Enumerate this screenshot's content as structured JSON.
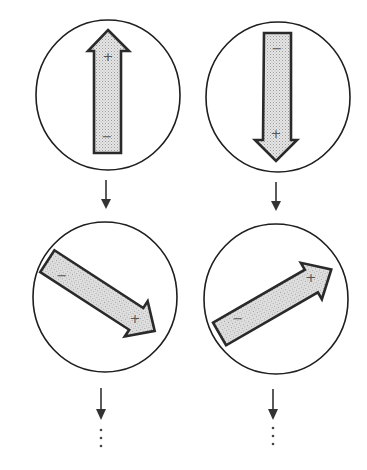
{
  "diagram": {
    "colors": {
      "outline": "#1e1e1e",
      "magnet_fill": "#d9d9d9",
      "magnet_stroke": "#2a2a2a",
      "background": "#ffffff"
    },
    "columns": [
      {
        "name": "left",
        "steps": [
          {
            "orientation": "up",
            "head_label": "+",
            "tail_label": "−"
          },
          {
            "orientation": "down-right",
            "head_label": "+",
            "tail_label": "−"
          }
        ],
        "continuation": "⋮"
      },
      {
        "name": "right",
        "steps": [
          {
            "orientation": "down",
            "head_label": "+",
            "tail_label": "−"
          },
          {
            "orientation": "up-right",
            "head_label": "+",
            "tail_label": "−"
          }
        ],
        "continuation": "⋮"
      }
    ]
  }
}
